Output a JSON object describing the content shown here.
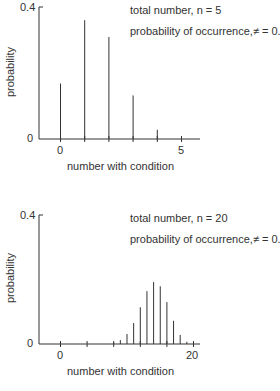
{
  "chart_data": [
    {
      "type": "bar",
      "subtype": "stem",
      "title": "",
      "annotations": [
        "total number, n = 5",
        "probability of occurrence,≠ = 0.3"
      ],
      "xlabel": "number with condition",
      "ylabel": "probability",
      "x": [
        0,
        1,
        2,
        3,
        4,
        5
      ],
      "values": [
        0.168,
        0.36,
        0.309,
        0.132,
        0.028,
        0.002
      ],
      "ylim": [
        0,
        0.4
      ],
      "yticks": [
        "0",
        "0.4"
      ],
      "xticks": [
        "0",
        "5"
      ],
      "grid": false
    },
    {
      "type": "bar",
      "subtype": "stem",
      "title": "",
      "annotations": [
        "total number, n = 20",
        "probability of occurrence,≠ = 0.7"
      ],
      "xlabel": "number with condition",
      "ylabel": "probability",
      "x": [
        8,
        9,
        10,
        11,
        12,
        13,
        14,
        15,
        16,
        17,
        18,
        19,
        20
      ],
      "values": [
        0.004,
        0.012,
        0.031,
        0.065,
        0.114,
        0.164,
        0.192,
        0.179,
        0.13,
        0.072,
        0.028,
        0.007,
        0.001
      ],
      "ylim": [
        0,
        0.4
      ],
      "yticks": [
        "0",
        "0.4"
      ],
      "xticks": [
        "0",
        "20"
      ],
      "grid": false
    }
  ],
  "top": {
    "n_label": "total number, n = 5",
    "p_label": "probability of occurrence,≠ = 0.3",
    "xlabel": "number with condition",
    "ylabel": "probability",
    "ytick_top": "0.4",
    "ytick_bottom": "0",
    "xtick_left": "0",
    "xtick_right": "5"
  },
  "bottom": {
    "n_label": "total number, n = 20",
    "p_label": "probability of occurrence,≠ = 0.7",
    "xlabel": "number with condition",
    "ylabel": "probability",
    "ytick_top": "0.4",
    "ytick_bottom": "0",
    "xtick_left": "0",
    "xtick_right": "20"
  }
}
